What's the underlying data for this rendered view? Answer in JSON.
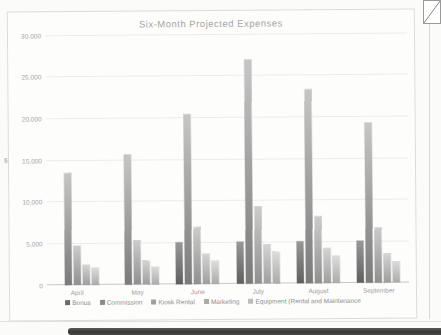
{
  "chart_data": {
    "type": "bar",
    "title": "Six-Month Projected Expenses",
    "ylabel": "$",
    "xlabel": "",
    "ylim": [
      0,
      30000
    ],
    "ytick_interval": 5000,
    "yticks": [
      {
        "value": 0,
        "label": "0"
      },
      {
        "value": 5000,
        "label": "5,000"
      },
      {
        "value": 10000,
        "label": "10,000"
      },
      {
        "value": 15000,
        "label": "15,000"
      },
      {
        "value": 20000,
        "label": "20,000"
      },
      {
        "value": 25000,
        "label": "25,000"
      },
      {
        "value": 30000,
        "label": "30,000"
      }
    ],
    "categories": [
      "April",
      "May",
      "June",
      "July",
      "August",
      "September"
    ],
    "series": [
      {
        "name": "Bonus",
        "values": [
          0,
          0,
          5000,
          5000,
          5000,
          5000
        ],
        "color_bottom": "#5f5f5f",
        "color_top": "#989898",
        "legend_color": "#6b6b6b"
      },
      {
        "name": "Commission",
        "values": [
          13400,
          15600,
          20400,
          26900,
          23300,
          19200
        ],
        "color_bottom": "#7a7a7a",
        "color_top": "#c6c6c6",
        "legend_color": "#8a8a8a"
      },
      {
        "name": "Kiosk Rental",
        "values": [
          4700,
          5300,
          6900,
          9200,
          8000,
          6600
        ],
        "color_bottom": "#8f8f8f",
        "color_top": "#cccccc",
        "legend_color": "#9e9e9e"
      },
      {
        "name": "Marketing",
        "values": [
          2400,
          2900,
          3600,
          4700,
          4200,
          3500
        ],
        "color_bottom": "#9e9e9e",
        "color_top": "#d4d4d4",
        "legend_color": "#ababab"
      },
      {
        "name": "Equipment (Rental and Maintenance",
        "values": [
          2000,
          2200,
          2800,
          3900,
          3200,
          2500
        ],
        "color_bottom": "#ababab",
        "color_top": "#dcdcdc",
        "legend_color": "#bcbcbc"
      }
    ],
    "grid": true,
    "legend_position": "bottom"
  },
  "page": {
    "background": "#fbfbf9",
    "frame_border": "#dcdcdc",
    "gridline_color": "#ececec",
    "scan_band_color": "#424242",
    "edge_line_color": "#d8d8d8"
  }
}
